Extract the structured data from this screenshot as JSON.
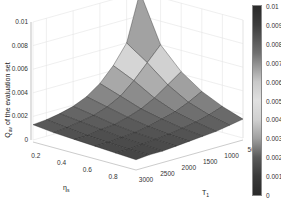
{
  "chart_data": {
    "type": "surface",
    "title": "",
    "xlabel": "η_s",
    "ylabel": "T_1",
    "zlabel": "Q_av of the evaluation set",
    "x_ticks": [
      "0.2",
      "0.4",
      "0.6",
      "0.8"
    ],
    "y_ticks": [
      "500",
      "1000",
      "1500",
      "2000",
      "2500",
      "3000"
    ],
    "z_ticks": [
      "0",
      "0.002",
      "0.004",
      "0.006",
      "0.008",
      "0.01"
    ],
    "x": [
      0.1,
      0.2,
      0.3,
      0.4,
      0.5,
      0.6,
      0.7,
      0.8,
      0.9
    ],
    "y": [
      500,
      1000,
      1500,
      2000,
      2500,
      3000
    ],
    "zlim": [
      0,
      0.01
    ],
    "z": [
      [
        0.01,
        0.006,
        0.0042,
        0.003,
        0.0022,
        0.0016
      ],
      [
        0.006,
        0.0048,
        0.0034,
        0.0024,
        0.0018,
        0.0014
      ],
      [
        0.0044,
        0.0036,
        0.0026,
        0.0019,
        0.0015,
        0.0012
      ],
      [
        0.0032,
        0.0026,
        0.002,
        0.0016,
        0.0013,
        0.0011
      ],
      [
        0.0024,
        0.002,
        0.0016,
        0.0013,
        0.0011,
        0.001
      ],
      [
        0.0019,
        0.0016,
        0.0013,
        0.0011,
        0.001,
        0.0009
      ],
      [
        0.0016,
        0.0014,
        0.0012,
        0.001,
        0.0009,
        0.0008
      ],
      [
        0.0014,
        0.0012,
        0.001,
        0.0009,
        0.0008,
        0.0008
      ],
      [
        0.0013,
        0.0011,
        0.001,
        0.0009,
        0.0008,
        0.0007
      ]
    ],
    "colorbar": {
      "ticks": [
        "0",
        "0.001",
        "0.002",
        "0.003",
        "0.004",
        "0.005",
        "0.006",
        "0.007",
        "0.008",
        "0.009",
        "0.01"
      ],
      "range": [
        0,
        0.01
      ],
      "colormap": "gray dark-light-dark"
    },
    "grid": true,
    "legend": null
  }
}
